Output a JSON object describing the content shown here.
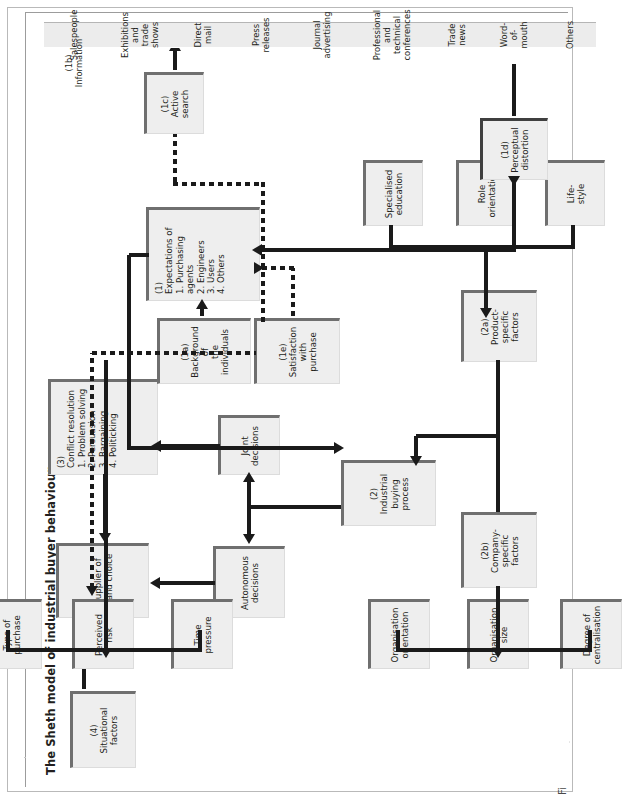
{
  "figure": {
    "title": "The Sheth model of industrial buyer behaviour",
    "caption": "Fig 5.13"
  },
  "colors": {
    "box_fill": "#eeeeee",
    "box_shadow": "#6f6f6f",
    "connector": "#1a1a1a",
    "text": "#231f20",
    "frame": "#b9b9b9"
  },
  "boxes": {
    "situational_factors": {
      "tag": "(4)",
      "line1": "Situational",
      "line2": "factors"
    },
    "supplier_brand_choice": {
      "line1": "Supplier of",
      "line2": "brand choice"
    },
    "conflict_resolution": {
      "tag": "(3)",
      "title": "Conflict resolution",
      "items": [
        "1. Problem solving",
        "2. Persuasion",
        "3. Bargaining",
        "4. Politicking"
      ]
    },
    "autonomous_decisions": {
      "line1": "Autonomous",
      "line2": "decisions"
    },
    "joint_decisions": {
      "line1": "Joint",
      "line2": "decisions"
    },
    "industrial_buying_process": {
      "tag": "(2)",
      "line1": "Industrial buying",
      "line2": "process"
    },
    "company_specific_factors": {
      "tag": "(2b)",
      "line1": "Company-specific",
      "line2": "factors"
    },
    "product_specific_factors": {
      "tag": "(2a)",
      "line1": "Product-specific",
      "line2": "factors"
    },
    "organisation_orientation": {
      "line1": "Organisation",
      "line2": "orientation"
    },
    "organisation_size": {
      "line1": "Organisation",
      "line2": "size"
    },
    "degree_of_centralisation": {
      "line1": "Degree of",
      "line2": "centralisation"
    },
    "time_pressure": {
      "line1": "Time",
      "line2": "pressure"
    },
    "perceived_risk": {
      "line1": "Perceived",
      "line2": "risk"
    },
    "type_of_purchase": {
      "line1": "Type of",
      "line2": "purchase"
    },
    "background_individuals": {
      "tag": "(1a)",
      "line1": "Background of",
      "line2": "the individuals"
    },
    "satisfaction_with_purchase": {
      "tag": "(1e)",
      "line1": "Satisfaction",
      "line2": "with purchase"
    },
    "expectations": {
      "tag": "(1)",
      "title": "Expectations of",
      "items": [
        "1. Purchasing agents",
        "2. Engineers",
        "3. Users",
        "4. Others"
      ]
    },
    "specialised_education": {
      "line1": "Specialised",
      "line2": "education"
    },
    "role_orientation": {
      "line1": "Role",
      "line2": "orientation"
    },
    "lifestyle": {
      "line1": "Life-",
      "line2": "style"
    },
    "active_search": {
      "tag": "(1c)",
      "line1": "Active",
      "line2": "search"
    },
    "perceptual_distortion": {
      "tag": "(1d)",
      "line1": "Perceptual",
      "line2": "distortion"
    }
  },
  "information": {
    "tag": "(1b)",
    "label": "Information",
    "sources": [
      {
        "line1": "Salespeople",
        "line2": ""
      },
      {
        "line1": "Exhibitions and",
        "line2": "trade shows"
      },
      {
        "line1": "Direct mail",
        "line2": ""
      },
      {
        "line1": "Press releases",
        "line2": ""
      },
      {
        "line1": "Journal",
        "line2": "advertising"
      },
      {
        "line1": "Professional",
        "line2": "and technical",
        "line3": "conferences"
      },
      {
        "line1": "Trade news",
        "line2": ""
      },
      {
        "line1": "Word-of-mouth",
        "line2": ""
      },
      {
        "line1": "Others",
        "line2": ""
      }
    ]
  }
}
